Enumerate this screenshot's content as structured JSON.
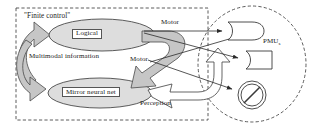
{
  "figure": {
    "kind": "cognitive-architecture-diagram",
    "background": "#ffffff",
    "stroke_color": "#3a3a3a",
    "fill_gray": "#c9c9c9",
    "oval_fill": "#dcdcdc"
  },
  "finite_control_box": {
    "label": "\"Finite control\"",
    "border_style": "dashed"
  },
  "nodes": {
    "logical": {
      "label": "Logical",
      "shape": "ellipse"
    },
    "mirror_neural_net": {
      "label": "Mirror neural net",
      "shape": "ellipse"
    }
  },
  "cycle": {
    "label": "Multimodal information"
  },
  "edges": [
    {
      "label": "Motor",
      "position": "top"
    },
    {
      "label": "Motor",
      "position": "middle"
    },
    {
      "label": "Perception",
      "position": "bottom"
    }
  ],
  "pmu_group": {
    "label": "PMUs",
    "label_base": "PMU",
    "label_sub": "s",
    "border_style": "dashed",
    "units": [
      {
        "name": "pmu-unit-top",
        "shape": "rounded-concave-block"
      },
      {
        "name": "pmu-unit-middle",
        "shape": "bullet-block"
      },
      {
        "name": "pmu-unit-bottom",
        "shape": "prohibition-symbol"
      }
    ]
  }
}
